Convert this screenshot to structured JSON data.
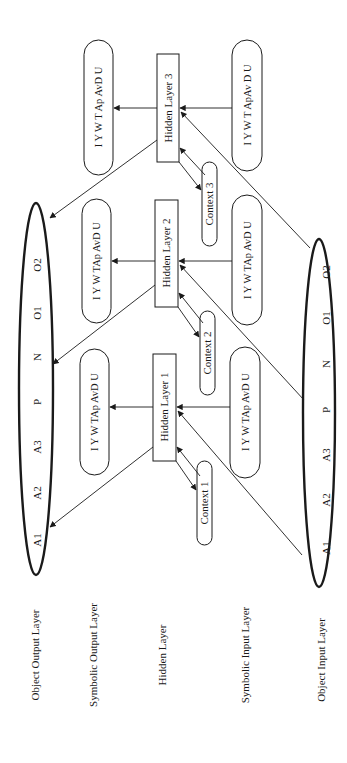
{
  "diagram": {
    "orientation": "rotated-90-ccw",
    "colors": {
      "stroke": "#1a1a1a",
      "background": "#ffffff",
      "text": "#1a1a1a"
    },
    "layer_labels": [
      {
        "id": "object-output",
        "label": "Object Output Layer",
        "x": 39,
        "y": 655
      },
      {
        "id": "symbolic-output",
        "label": "Symbolic Output Layer",
        "x": 97,
        "y": 655
      },
      {
        "id": "hidden",
        "label": "Hidden Layer",
        "x": 166,
        "y": 655
      },
      {
        "id": "symbolic-input",
        "label": "Symbolic Input Layer",
        "x": 249,
        "y": 655
      },
      {
        "id": "object-input",
        "label": "Object Input Layer",
        "x": 325,
        "y": 660
      }
    ],
    "object_output_layer": {
      "units": [
        "A1",
        "A2",
        "A3",
        "P",
        "N",
        "O1",
        "O2"
      ]
    },
    "object_input_layer": {
      "units": [
        "A1",
        "A2",
        "A3",
        "P",
        "N",
        "O1",
        "O2"
      ]
    },
    "hidden_layers": [
      {
        "id": "h1",
        "label": "Hidden Layer 1"
      },
      {
        "id": "h2",
        "label": "Hidden Layer 2"
      },
      {
        "id": "h3",
        "label": "Hidden Layer 3"
      }
    ],
    "contexts": [
      {
        "id": "c1",
        "label": "Context 1"
      },
      {
        "id": "c2",
        "label": "Context 2"
      },
      {
        "id": "c3",
        "label": "Context 3"
      }
    ],
    "symbolic_output": [
      {
        "id": "so1",
        "label": "I  Y  W  TAp  AvD U"
      },
      {
        "id": "so2",
        "label": "I  Y  W  TAp  AvD U"
      },
      {
        "id": "so3",
        "label": "I  Y  W  T  Ap  AvD U"
      }
    ],
    "symbolic_input": [
      {
        "id": "si1",
        "label": "I  Y  W  TAp  AvD U"
      },
      {
        "id": "si2",
        "label": "I  Y  W  TAp  AvD U"
      },
      {
        "id": "si3",
        "label": "I  Y  W  T   ApAv D U"
      }
    ]
  }
}
